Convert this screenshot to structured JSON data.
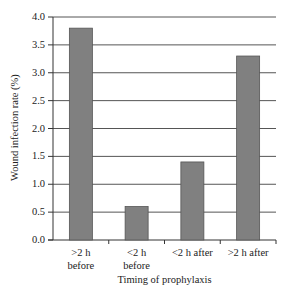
{
  "chart_data": {
    "type": "bar",
    "title": "",
    "xlabel": "Timing of prophylaxis",
    "ylabel": "Wound infection rate (%)",
    "categories": [
      ">2 h before",
      "<2 h before",
      "<2 h after",
      ">2 h after"
    ],
    "category_lines": [
      [
        ">2 h",
        "before"
      ],
      [
        "<2 h",
        "before"
      ],
      [
        "<2 h after"
      ],
      [
        ">2 h after"
      ]
    ],
    "values": [
      3.8,
      0.6,
      1.4,
      3.3
    ],
    "ylim": [
      0,
      4.0
    ],
    "yticks": [
      "0.0",
      "0.5",
      "1.0",
      "1.5",
      "2.0",
      "2.5",
      "3.0",
      "3.5",
      "4.0"
    ],
    "grid": true,
    "legend": null,
    "bar_color": "#808080"
  }
}
